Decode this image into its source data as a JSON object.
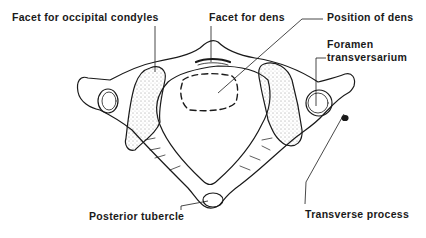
{
  "diagram": {
    "labels": {
      "facet_occipital": "Facet for occipital condyles",
      "facet_dens": "Facet for dens",
      "position_dens": "Position of dens",
      "foramen_line1": "Foramen",
      "foramen_line2": "transversarium",
      "posterior_tubercle": "Posterior tubercle",
      "transverse_process": "Transverse process"
    },
    "colors": {
      "ink": "#1a1a1a",
      "background": "#ffffff"
    }
  }
}
